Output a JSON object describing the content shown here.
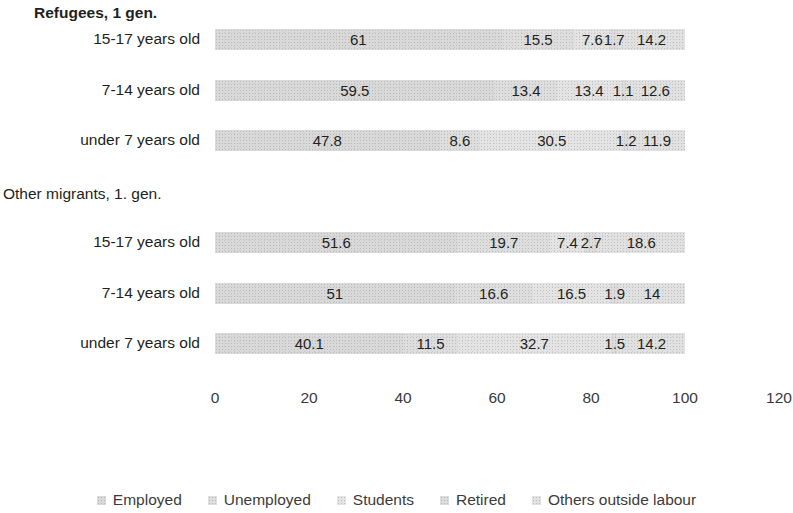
{
  "chart_data": {
    "type": "bar",
    "subtype": "stacked-horizontal",
    "title": "",
    "xlabel": "",
    "ylabel": "",
    "xlim": [
      0,
      120
    ],
    "xticks": [
      0,
      20,
      40,
      60,
      80,
      100,
      120
    ],
    "grid": false,
    "legend_position": "bottom",
    "series": [
      {
        "name": "Employed",
        "color": "#d9d9d9",
        "values": [
          61,
          59.5,
          47.8,
          51.6,
          51,
          40.1
        ]
      },
      {
        "name": "Unemployed",
        "color": "#dedede",
        "values": [
          15.5,
          13.4,
          8.6,
          19.7,
          16.6,
          11.5
        ]
      },
      {
        "name": "Students",
        "color": "#e4e4e4",
        "values": [
          7.6,
          13.4,
          30.5,
          7.4,
          16.5,
          32.7
        ]
      },
      {
        "name": "Retired",
        "color": "#dcdcdc",
        "values": [
          1.7,
          1.1,
          1.2,
          2.7,
          1.9,
          1.5
        ]
      },
      {
        "name": "Others outside labour",
        "color": "#e1e1e1",
        "values": [
          14.2,
          12.6,
          11.9,
          18.6,
          14,
          14.2
        ]
      }
    ],
    "groups": [
      {
        "label": "Refugees, 1 gen.",
        "bold": true,
        "categories": [
          "15-17 years old",
          "7-14 years old",
          "under 7 years old"
        ]
      },
      {
        "label": "Other migrants, 1. gen.",
        "bold": false,
        "categories": [
          "15-17 years old",
          "7-14 years old",
          "under 7 years old"
        ]
      }
    ],
    "rows": [
      {
        "group": "Refugees, 1 gen.",
        "category": "15-17 years old",
        "values": [
          61,
          15.5,
          7.6,
          1.7,
          14.2
        ],
        "labels": [
          "61",
          "15.5",
          "7.6",
          "1.7",
          "14.2"
        ]
      },
      {
        "group": "Refugees, 1 gen.",
        "category": "7-14 years old",
        "values": [
          59.5,
          13.4,
          13.4,
          1.1,
          12.6
        ],
        "labels": [
          "59.5",
          "13.4",
          "13.4",
          "1.1",
          "12.6"
        ]
      },
      {
        "group": "Refugees, 1 gen.",
        "category": "under 7 years old",
        "values": [
          47.8,
          8.6,
          30.5,
          1.2,
          11.9
        ],
        "labels": [
          "47.8",
          "8.6",
          "30.5",
          "1.2",
          "11.9"
        ]
      },
      {
        "group": "Other migrants, 1. gen.",
        "category": "15-17 years old",
        "values": [
          51.6,
          19.7,
          7.4,
          2.7,
          18.6
        ],
        "labels": [
          "51.6",
          "19.7",
          "7.4",
          "2.7",
          "18.6"
        ]
      },
      {
        "group": "Other migrants, 1. gen.",
        "category": "7-14 years old",
        "values": [
          51,
          16.6,
          16.5,
          1.9,
          14
        ],
        "labels": [
          "51",
          "16.6",
          "16.5",
          "1.9",
          "14"
        ]
      },
      {
        "group": "Other migrants, 1. gen.",
        "category": "under 7 years old",
        "values": [
          40.1,
          11.5,
          32.7,
          1.5,
          14.2
        ],
        "labels": [
          "40.1",
          "11.5",
          "32.7",
          "1.5",
          "14.2"
        ]
      }
    ]
  }
}
